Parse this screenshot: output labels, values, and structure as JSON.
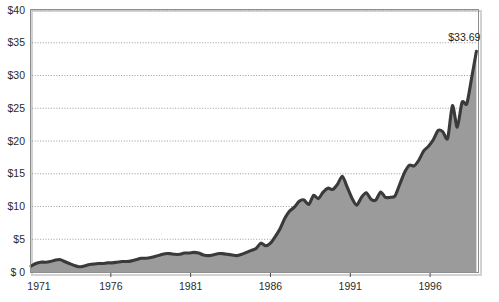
{
  "chart_data": {
    "type": "area",
    "title": "",
    "subtitle": "",
    "xlabel": "",
    "ylabel": "",
    "xlim": [
      1971,
      1999
    ],
    "ylim": [
      0,
      40
    ],
    "grid": true,
    "legend": null,
    "series_name": "Price",
    "colors": {
      "line": "#3a3a3a",
      "fill": "#9b9b9b",
      "grid": "#8d8d8d",
      "frame": "#8e8e8e",
      "frame_shadow": "#d2d2d2",
      "background": "#ffffff",
      "text": "#2b2b2b"
    },
    "y_ticks": [
      0,
      5,
      10,
      15,
      20,
      25,
      30,
      35,
      40
    ],
    "y_tick_labels": [
      "$ 0",
      "$5",
      "$10",
      "$15",
      "$20",
      "$25",
      "$30",
      "$35",
      "$40"
    ],
    "x_ticks": [
      1971,
      1976,
      1981,
      1986,
      1991,
      1996
    ],
    "x_tick_labels": [
      "1971",
      "1976",
      "1981",
      "1986",
      "1991",
      "1996"
    ],
    "annotations": [
      {
        "text": "$33.69",
        "x": 1998.9,
        "y": 33.69,
        "name": "final-value-label"
      }
    ],
    "x": [
      1971.0,
      1971.3,
      1971.6,
      1971.9,
      1972.2,
      1972.5,
      1972.8,
      1973.1,
      1973.4,
      1973.7,
      1974.0,
      1974.3,
      1974.6,
      1974.9,
      1975.2,
      1975.5,
      1975.8,
      1976.1,
      1976.4,
      1976.7,
      1977.0,
      1977.3,
      1977.6,
      1977.9,
      1978.2,
      1978.5,
      1978.8,
      1979.1,
      1979.4,
      1979.7,
      1980.0,
      1980.3,
      1980.6,
      1980.9,
      1981.2,
      1981.5,
      1981.8,
      1982.1,
      1982.4,
      1982.7,
      1983.0,
      1983.3,
      1983.6,
      1983.9,
      1984.2,
      1984.5,
      1984.8,
      1985.1,
      1985.4,
      1985.7,
      1986.0,
      1986.3,
      1986.6,
      1986.9,
      1987.2,
      1987.5,
      1987.8,
      1988.1,
      1988.4,
      1988.7,
      1989.0,
      1989.3,
      1989.6,
      1989.9,
      1990.2,
      1990.5,
      1990.8,
      1991.1,
      1991.4,
      1991.7,
      1992.0,
      1992.3,
      1992.6,
      1992.9,
      1993.2,
      1993.5,
      1993.8,
      1994.1,
      1994.4,
      1994.7,
      1995.0,
      1995.3,
      1995.6,
      1995.9,
      1996.2,
      1996.5,
      1996.8,
      1997.1,
      1997.4,
      1997.7,
      1998.0,
      1998.3,
      1998.6,
      1998.9
    ],
    "values": [
      0.9,
      1.3,
      1.5,
      1.5,
      1.6,
      1.8,
      1.9,
      1.6,
      1.3,
      1.0,
      0.8,
      0.9,
      1.1,
      1.2,
      1.3,
      1.3,
      1.4,
      1.4,
      1.5,
      1.6,
      1.6,
      1.7,
      1.9,
      2.1,
      2.1,
      2.2,
      2.4,
      2.6,
      2.8,
      2.8,
      2.7,
      2.7,
      2.9,
      2.9,
      3.0,
      2.9,
      2.6,
      2.5,
      2.6,
      2.8,
      2.8,
      2.7,
      2.6,
      2.5,
      2.7,
      3.0,
      3.3,
      3.6,
      4.4,
      4.0,
      4.4,
      5.4,
      6.6,
      8.2,
      9.3,
      9.9,
      10.8,
      11.0,
      10.3,
      11.7,
      11.2,
      12.2,
      12.8,
      12.6,
      13.4,
      14.6,
      13.0,
      11.3,
      10.2,
      11.4,
      12.1,
      11.1,
      11.0,
      12.2,
      11.4,
      11.4,
      11.6,
      13.4,
      15.2,
      16.3,
      16.2,
      17.1,
      18.5,
      19.2,
      20.2,
      21.6,
      21.4,
      20.4,
      25.4,
      22.1,
      25.9,
      25.7,
      29.6,
      33.69
    ]
  }
}
